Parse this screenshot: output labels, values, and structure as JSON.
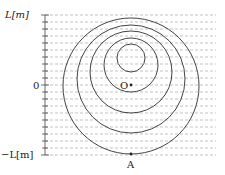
{
  "axis": {
    "top_label": "L[m]",
    "zero_label": "0",
    "bottom_label": "−L[m]"
  },
  "points": {
    "center_label": "O",
    "bottom_label": "A"
  },
  "colors": {
    "line": "#444444",
    "dash": "#9a9a9a",
    "text": "#222222"
  },
  "grid": {
    "dashed_line_count": 21,
    "spacing_px": 7
  },
  "circles": [
    {
      "cx": 131,
      "cy": 58,
      "r": 14
    },
    {
      "cx": 131,
      "cy": 65,
      "r": 27
    },
    {
      "cx": 131,
      "cy": 72,
      "r": 41
    },
    {
      "cx": 131,
      "cy": 79,
      "r": 54
    },
    {
      "cx": 131,
      "cy": 86,
      "r": 68
    }
  ]
}
